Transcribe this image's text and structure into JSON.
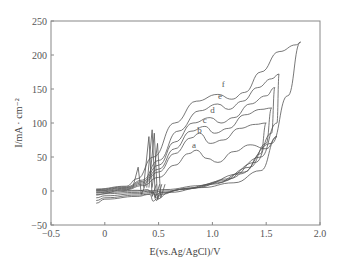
{
  "chart_data": {
    "type": "line",
    "title": "",
    "xlabel": "E(vs.Ag/AgCl)/V",
    "ylabel": "I/mA · cm⁻²",
    "xlim": [
      -0.5,
      2.0
    ],
    "ylim": [
      -50,
      250
    ],
    "x_ticks": [
      "-0.5",
      "0",
      "0.5",
      "1.0",
      "1.5",
      "2.0"
    ],
    "y_ticks": [
      "-50",
      "0",
      "50",
      "100",
      "150",
      "200",
      "250"
    ],
    "grid": false,
    "legend": "inline curve labels",
    "series": [
      {
        "name": "a",
        "label_pos": [
          0.83,
          60
        ],
        "forward": [
          [
            -0.08,
            -5
          ],
          [
            0.2,
            2
          ],
          [
            0.35,
            8
          ],
          [
            0.5,
            20
          ],
          [
            0.65,
            38
          ],
          [
            0.78,
            55
          ],
          [
            0.85,
            60
          ],
          [
            0.95,
            48
          ],
          [
            1.05,
            42
          ],
          [
            1.2,
            58
          ],
          [
            1.35,
            68
          ],
          [
            1.5,
            62
          ],
          [
            1.6,
            80
          ]
        ],
        "reverse": [
          [
            1.6,
            80
          ],
          [
            1.45,
            30
          ],
          [
            1.2,
            12
          ],
          [
            0.9,
            5
          ],
          [
            0.6,
            -2
          ],
          [
            0.48,
            -12
          ],
          [
            0.45,
            -15
          ],
          [
            0.42,
            -5
          ],
          [
            0.3,
            -8
          ],
          [
            0.0,
            -12
          ],
          [
            -0.08,
            -18
          ]
        ]
      },
      {
        "name": "b",
        "label_pos": [
          0.88,
          83
        ],
        "forward": [
          [
            -0.08,
            -2
          ],
          [
            0.2,
            3
          ],
          [
            0.35,
            10
          ],
          [
            0.5,
            28
          ],
          [
            0.65,
            55
          ],
          [
            0.8,
            78
          ],
          [
            0.88,
            85
          ],
          [
            0.98,
            70
          ],
          [
            1.1,
            75
          ],
          [
            1.25,
            92
          ],
          [
            1.4,
            98
          ],
          [
            1.5,
            100
          ]
        ],
        "reverse": [
          [
            1.5,
            100
          ],
          [
            1.45,
            55
          ],
          [
            1.3,
            28
          ],
          [
            1.0,
            10
          ],
          [
            0.7,
            2
          ],
          [
            0.52,
            -5
          ],
          [
            0.48,
            -14
          ],
          [
            0.45,
            -4
          ],
          [
            0.3,
            -6
          ],
          [
            0.0,
            -10
          ],
          [
            -0.08,
            -14
          ]
        ]
      },
      {
        "name": "c",
        "label_pos": [
          0.93,
          97
        ],
        "forward": [
          [
            -0.08,
            0
          ],
          [
            0.2,
            4
          ],
          [
            0.35,
            12
          ],
          [
            0.5,
            32
          ],
          [
            0.65,
            62
          ],
          [
            0.8,
            88
          ],
          [
            0.93,
            95
          ],
          [
            1.02,
            85
          ],
          [
            1.15,
            92
          ],
          [
            1.3,
            112
          ],
          [
            1.45,
            120
          ],
          [
            1.55,
            122
          ]
        ],
        "reverse": [
          [
            1.55,
            122
          ],
          [
            1.5,
            70
          ],
          [
            1.35,
            35
          ],
          [
            1.05,
            12
          ],
          [
            0.75,
            3
          ],
          [
            0.52,
            -3
          ],
          [
            0.48,
            -10
          ],
          [
            0.45,
            -2
          ],
          [
            0.3,
            -4
          ],
          [
            0.0,
            -7
          ],
          [
            -0.08,
            -10
          ]
        ]
      },
      {
        "name": "d",
        "label_pos": [
          1.0,
          112
        ],
        "forward": [
          [
            -0.08,
            1
          ],
          [
            0.2,
            5
          ],
          [
            0.35,
            14
          ],
          [
            0.5,
            38
          ],
          [
            0.65,
            72
          ],
          [
            0.82,
            100
          ],
          [
            0.98,
            108
          ],
          [
            1.08,
            100
          ],
          [
            1.2,
            108
          ],
          [
            1.35,
            128
          ],
          [
            1.5,
            140
          ],
          [
            1.58,
            152
          ]
        ],
        "reverse": [
          [
            1.58,
            152
          ],
          [
            1.55,
            85
          ],
          [
            1.4,
            42
          ],
          [
            1.1,
            15
          ],
          [
            0.8,
            4
          ],
          [
            0.52,
            -2
          ],
          [
            0.47,
            -6
          ],
          [
            0.44,
            0
          ],
          [
            0.3,
            -2
          ],
          [
            0.0,
            -4
          ],
          [
            -0.08,
            -6
          ]
        ]
      },
      {
        "name": "e",
        "label_pos": [
          1.07,
          133
        ],
        "forward": [
          [
            -0.08,
            2
          ],
          [
            0.2,
            6
          ],
          [
            0.35,
            16
          ],
          [
            0.5,
            45
          ],
          [
            0.68,
            88
          ],
          [
            0.88,
            118
          ],
          [
            1.05,
            128
          ],
          [
            1.15,
            120
          ],
          [
            1.28,
            132
          ],
          [
            1.42,
            152
          ],
          [
            1.55,
            165
          ],
          [
            1.62,
            172
          ]
        ],
        "reverse": [
          [
            1.62,
            172
          ],
          [
            1.6,
            100
          ],
          [
            1.45,
            50
          ],
          [
            1.15,
            18
          ],
          [
            0.85,
            5
          ],
          [
            0.55,
            0
          ],
          [
            0.43,
            -2
          ],
          [
            0.4,
            2
          ],
          [
            0.3,
            0
          ],
          [
            0.0,
            -2
          ],
          [
            -0.08,
            -3
          ]
        ]
      },
      {
        "name": "f",
        "label_pos": [
          1.1,
          150
        ],
        "forward": [
          [
            -0.08,
            3
          ],
          [
            0.2,
            7
          ],
          [
            0.3,
            18
          ],
          [
            0.45,
            50
          ],
          [
            0.65,
            100
          ],
          [
            0.85,
            132
          ],
          [
            1.05,
            142
          ],
          [
            1.18,
            135
          ],
          [
            1.3,
            145
          ],
          [
            1.45,
            175
          ],
          [
            1.62,
            205
          ],
          [
            1.78,
            215
          ],
          [
            1.82,
            219
          ]
        ],
        "reverse": [
          [
            1.82,
            219
          ],
          [
            1.7,
            140
          ],
          [
            1.55,
            70
          ],
          [
            1.25,
            25
          ],
          [
            0.9,
            8
          ],
          [
            0.55,
            2
          ],
          [
            0.4,
            0
          ],
          [
            0.3,
            1
          ],
          [
            0.0,
            0
          ],
          [
            -0.08,
            0
          ]
        ]
      }
    ],
    "anodic_spikes_near_V": [
      0.32,
      0.42,
      0.47
    ],
    "curve_labels": [
      "a",
      "b",
      "c",
      "d",
      "e",
      "f"
    ]
  }
}
